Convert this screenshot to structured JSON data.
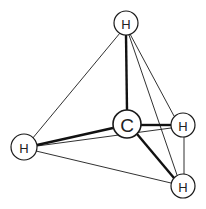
{
  "diagram": {
    "title": "",
    "atoms": {
      "top": {
        "label": "H",
        "x": 126,
        "y": 23,
        "r": 12
      },
      "carbon": {
        "label": "C",
        "x": 127,
        "y": 124,
        "r": 14
      },
      "right": {
        "label": "H",
        "x": 183,
        "y": 125,
        "r": 12
      },
      "left": {
        "label": "H",
        "x": 24,
        "y": 147,
        "r": 13
      },
      "bottom": {
        "label": "H",
        "x": 183,
        "y": 186,
        "r": 12
      }
    },
    "colors": {
      "stroke": "#1a1a1a",
      "fill": "#ffffff",
      "background": "#ffffff"
    }
  }
}
